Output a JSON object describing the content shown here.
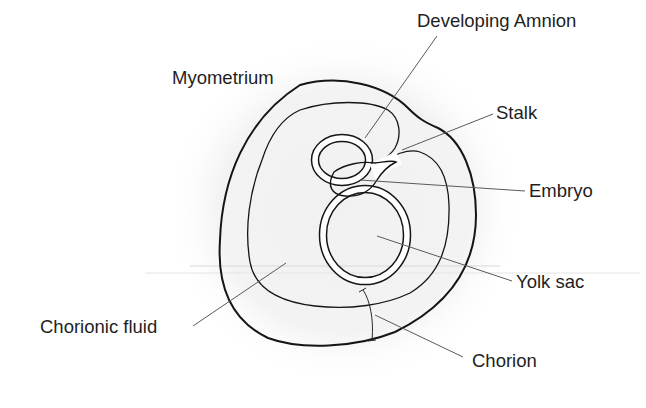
{
  "diagram": {
    "colors": {
      "background": "#ffffff",
      "fluid_fill": "#a9a9a9",
      "halo": "#efefef",
      "outline": "#151515",
      "leader_line": "#5a5a5a",
      "label_text": "#1e1e1e"
    },
    "labels": {
      "myometrium": "Myometrium",
      "developing_amnion": "Developing Amnion",
      "stalk": "Stalk",
      "embryo": "Embryo",
      "yolk_sac": "Yolk sac",
      "chorionic_fluid": "Chorionic fluid",
      "chorion": "Chorion"
    }
  }
}
